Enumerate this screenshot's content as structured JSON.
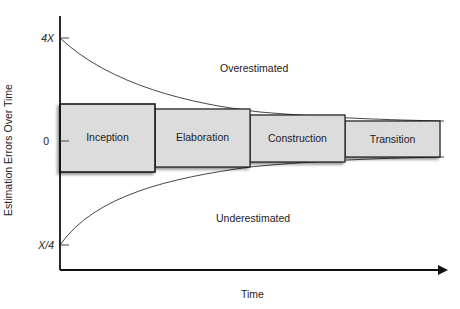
{
  "diagram": {
    "y_axis_label": "Estimation Errors Over Time",
    "x_axis_label": "Time",
    "y_ticks": [
      {
        "label": "4X",
        "y": 38
      },
      {
        "label": "0",
        "y": 141
      },
      {
        "label": "X/4",
        "y": 245
      }
    ],
    "regions": {
      "upper": "Overestimated",
      "lower": "Underestimated"
    },
    "phases": [
      {
        "label": "Inception",
        "x": 60,
        "y": 104,
        "w": 95,
        "h": 68
      },
      {
        "label": "Elaboration",
        "x": 155,
        "y": 109,
        "w": 95,
        "h": 58
      },
      {
        "label": "Construction",
        "x": 250,
        "y": 115,
        "w": 95,
        "h": 47
      },
      {
        "label": "Transition",
        "x": 345,
        "y": 121,
        "w": 95,
        "h": 36
      }
    ],
    "colors": {
      "box_fill": "#d9d9d9",
      "box_stroke": "#1a1a1a",
      "axis": "#111111",
      "curve": "#333333"
    }
  }
}
